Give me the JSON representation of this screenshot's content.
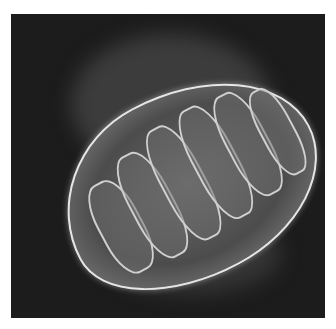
{
  "image": {
    "subject": "mitochondrion",
    "background_color": "#1c1c1c",
    "frame_color": "#ffffff",
    "highlight_color": "#e6e6e6"
  }
}
